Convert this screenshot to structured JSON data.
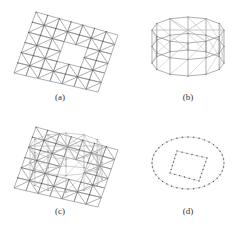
{
  "figure": {
    "stroke_color": "#7a7a7a",
    "light_stroke_color": "#b4b4b4",
    "node_color": "#555555",
    "panels": [
      {
        "id": "a",
        "caption": "(a)",
        "caption_pos": [
          40,
          92
        ],
        "kind": "plate_with_hole",
        "corners": [
          [
            36,
            12
          ],
          [
            118,
            35
          ],
          [
            98,
            92
          ],
          [
            14,
            73
          ]
        ],
        "grid": [
          7,
          6
        ],
        "hole": [
          [
            3,
            2
          ],
          [
            4,
            3
          ]
        ]
      },
      {
        "id": "b",
        "caption": "(b)",
        "caption_pos": [
          168,
          92
        ],
        "kind": "cylinder",
        "center": [
          188,
          30
        ],
        "rx": 36,
        "ry": 13,
        "height": 33,
        "segments": 12,
        "rings": 2
      },
      {
        "id": "c",
        "caption": "(c)",
        "caption_pos": [
          40,
          206
        ],
        "kind": "plate_with_cylinder",
        "corners": [
          [
            36,
            127
          ],
          [
            118,
            150
          ],
          [
            98,
            207
          ],
          [
            14,
            188
          ]
        ],
        "grid": [
          7,
          6
        ],
        "hole": [
          [
            3,
            2
          ],
          [
            4,
            3
          ]
        ],
        "center": [
          66,
          146
        ],
        "rx": 36,
        "ry": 13,
        "height": 33,
        "segments": 12,
        "rings": 2
      },
      {
        "id": "d",
        "caption": "(d)",
        "caption_pos": [
          168,
          206
        ],
        "kind": "outline",
        "ellipse": {
          "center": [
            188,
            163
          ],
          "rx": 36,
          "ry": 26
        },
        "quad": [
          [
            177,
            151
          ],
          [
            207,
            158
          ],
          [
            199,
            181
          ],
          [
            170,
            173
          ]
        ],
        "dots": 40
      }
    ]
  }
}
